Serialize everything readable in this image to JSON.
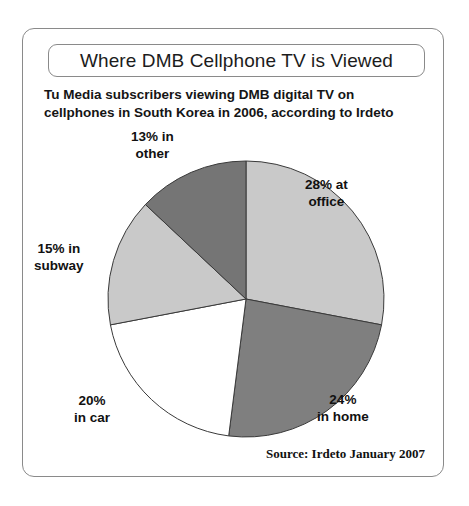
{
  "frame": {
    "title": "Where DMB Cellphone TV is Viewed",
    "subtitle_line1": "Tu Media subscribers viewing DMB digital TV on",
    "subtitle_line2": "cellphones in South Korea in 2006, according to Irdeto",
    "source": "Source: Irdeto January 2007"
  },
  "labels": {
    "office": {
      "line1": "28% at",
      "line2": "office"
    },
    "home": {
      "line1": "24%",
      "line2": "in home"
    },
    "car": {
      "line1": "20%",
      "line2": "in car"
    },
    "subway": {
      "line1": "15% in",
      "line2": "subway"
    },
    "other": {
      "line1": "13% in",
      "line2": "other"
    }
  },
  "chart_data": {
    "type": "pie",
    "title": "Where DMB Cellphone TV is Viewed",
    "subtitle": "Tu Media subscribers viewing DMB digital TV on cellphones in South Korea in 2006, according to Irdeto",
    "source": "Source: Irdeto January 2007",
    "units": "percent",
    "start_angle_deg": 0,
    "direction": "clockwise",
    "categories": [
      "at office",
      "in home",
      "in car",
      "in subway",
      "other"
    ],
    "values": [
      28,
      24,
      20,
      15,
      13
    ],
    "colors": [
      "#c9c9c9",
      "#7f7f7f",
      "#ffffff",
      "#c9c9c9",
      "#757575"
    ],
    "slice_border_color": "#3a3a3a",
    "legend": "none",
    "data_labels": [
      "28% at office",
      "24% in home",
      "20% in car",
      "15% in subway",
      "13% in other"
    ],
    "total": 100
  },
  "geometry": {
    "center_x": 223,
    "center_y": 270,
    "radius": 138
  }
}
